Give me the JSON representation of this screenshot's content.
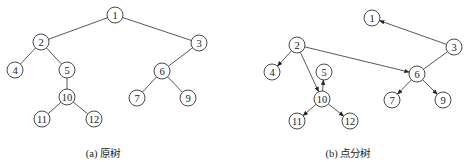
{
  "figures": [
    {
      "id": "a",
      "caption": "(a) 原树",
      "caption_pos": [
        103,
        152
      ],
      "directed": false,
      "nodes": [
        {
          "label": "1",
          "x": 115,
          "y": 15
        },
        {
          "label": "2",
          "x": 41,
          "y": 42
        },
        {
          "label": "3",
          "x": 199,
          "y": 43
        },
        {
          "label": "4",
          "x": 15,
          "y": 70
        },
        {
          "label": "5",
          "x": 67,
          "y": 70
        },
        {
          "label": "6",
          "x": 162,
          "y": 71
        },
        {
          "label": "10",
          "x": 67,
          "y": 97
        },
        {
          "label": "7",
          "x": 137,
          "y": 98
        },
        {
          "label": "9",
          "x": 188,
          "y": 98
        },
        {
          "label": "11",
          "x": 42,
          "y": 119
        },
        {
          "label": "12",
          "x": 94,
          "y": 119
        }
      ],
      "edges": [
        [
          "1",
          "2"
        ],
        [
          "1",
          "3"
        ],
        [
          "2",
          "4"
        ],
        [
          "2",
          "5"
        ],
        [
          "5",
          "10"
        ],
        [
          "10",
          "11"
        ],
        [
          "10",
          "12"
        ],
        [
          "3",
          "6"
        ],
        [
          "6",
          "7"
        ],
        [
          "6",
          "9"
        ]
      ]
    },
    {
      "id": "b",
      "caption": "(b) 点分树",
      "caption_pos": [
        348,
        152
      ],
      "directed": true,
      "nodes": [
        {
          "label": "1",
          "x": 372,
          "y": 18
        },
        {
          "label": "2",
          "x": 297,
          "y": 45
        },
        {
          "label": "3",
          "x": 454,
          "y": 47
        },
        {
          "label": "4",
          "x": 272,
          "y": 72
        },
        {
          "label": "5",
          "x": 324,
          "y": 72
        },
        {
          "label": "6",
          "x": 417,
          "y": 74
        },
        {
          "label": "10",
          "x": 322,
          "y": 99
        },
        {
          "label": "7",
          "x": 392,
          "y": 100
        },
        {
          "label": "9",
          "x": 443,
          "y": 100
        },
        {
          "label": "11",
          "x": 297,
          "y": 121
        },
        {
          "label": "12",
          "x": 350,
          "y": 121
        }
      ],
      "edges": [
        [
          "3",
          "1"
        ],
        [
          "3",
          "6"
        ],
        [
          "2",
          "4"
        ],
        [
          "2",
          "10"
        ],
        [
          "2",
          "6"
        ],
        [
          "10",
          "5"
        ],
        [
          "10",
          "11"
        ],
        [
          "10",
          "12"
        ],
        [
          "6",
          "7"
        ],
        [
          "6",
          "9"
        ]
      ],
      "undirected_edges": [
        [
          "3",
          "6"
        ]
      ]
    }
  ],
  "style": {
    "node_radius": 8,
    "stroke_color": "#333333",
    "edge_color": "#444444"
  }
}
